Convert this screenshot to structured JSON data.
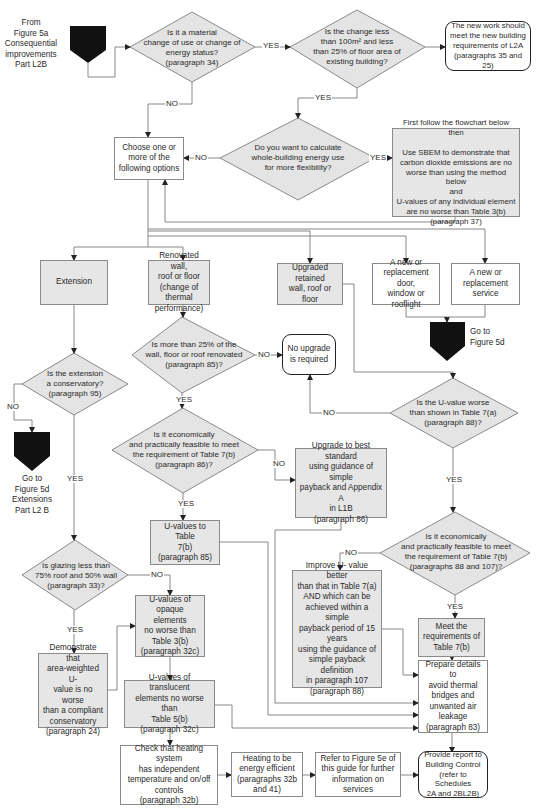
{
  "colors": {
    "line": "#6e6e6e",
    "decision_fill": "#e4e4e4",
    "process_grey": "#e6e6e6",
    "connector_black": "#111111",
    "terminal_border": "#222222"
  },
  "entry": {
    "text": "From\nFigure 5a\nConsequential\nimprovements\nPart L2B"
  },
  "decisions": {
    "material_change": "Is it a material\nchange of use or change of\nenergy status?\n(paragraph 34)",
    "change_less": "Is the change less\nthan 100m² and less\nthan 25% of floor area of\nexisting building?",
    "whole_building": "Do you want to calculate\nwhole-building energy use\nfor more flexibility?",
    "renovated_25": "Is more than 25% of the\nwall, floor or roof renovated\n(paragraph 85)?",
    "conservatory": "Is the extension\na conservatory?\n(paragraph 95)",
    "uvalue_worse": "Is the  U-value worse\nthan shown in Table 7(a)\n(paragraph 88)?",
    "econ_86": "Is it economically\nand practically feasible to meet\nthe requirement of Table 7(b)\n(paragraph 86)?",
    "econ_88_107": "Is it economically\nand practically feasible to meet\nthe requirement of Table 7(b)\n(paragraphs 88 and 107)?",
    "glazing": "Is glazing less than\n75% roof and 50% wall\n(paragraph 33)?"
  },
  "terminals": {
    "new_work": "The new work should\nmeet the new building\nrequirements of L2A\n(paragraphs 35 and 25)",
    "no_upgrade": "No upgrade\nis required",
    "provide_report": "Provide report to\nBuilding Control\n(refer to Schedules\n2A and 2BL2B)"
  },
  "processes": {
    "sbem": "First follow the flowchart below\nthen\n\nUse SBEM to demonstrate that\ncarbon dioxide emissions are no\nworse than using the method below\nand\nU-values of any individual element\nare no worse than Table 3(b)\n(paragraph 37)",
    "choose": "Choose one or\nmore of the\nfollowing options",
    "extension": "Extension",
    "renovated": "Renovated wall,\nroof or floor\n(change of thermal\nperformance)",
    "upgraded": "Upgraded retained\nwall, roof or floor",
    "new_door": "A new or\nreplacement door,\nwindow or rooflight",
    "new_service": "A new or\nreplacement\nservice",
    "upgrade_best": "Upgrade to best standard\nusing guidance of simple\npayback and Appendix A\nin L1B\n(paragraph 86)",
    "uvalues_7b": "U-values to Table\n7(b)\n(paragraph 85)",
    "improve_u": "Improve  U- value better\nthan that in Table 7(a)\nAND which can be\nachieved within a simple\npayback period of 15\nyears\nusing the guidance of\nsimple payback definition\nin paragraph 107\n(paragraph 88)",
    "meet_req": "Meet the\nrequirements of\nTable 7(b)",
    "opaque": "U-values of\nopaque elements\nno worse than\nTable 3(b)\n(paragraph 32c)",
    "demonstrate": "Demonstrate that\narea-weighted U-\nvalue is no worse\nthan a compliant\nconservatory\n(paragraph 24)",
    "translucent": "U-values of translucent\nelements no worse than\nTable 5(b)\n(paragraph 32c)",
    "prepare": "Prepare details to\navoid thermal\nbridges and\nunwanted air\nleakage\n(paragraph 83)",
    "check_heating": "Check that heating system\nhas independent\ntemperature and on/off\ncontrols\n(paragraph 32b)",
    "heating_eff": "Heating to be\nenergy efficient\n(paragraphs 32b\nand 41)",
    "refer_5e": "Refer to Figure 5e of\nthis guide for further\ninformation on services"
  },
  "connectors": {
    "goto_5d": "Go to\nFigure 5d",
    "goto_5d_ext": "Go to\nFigure 5d\nExtensions\nPart L2 B"
  },
  "labels": {
    "yes": "YES",
    "no": "NO"
  }
}
